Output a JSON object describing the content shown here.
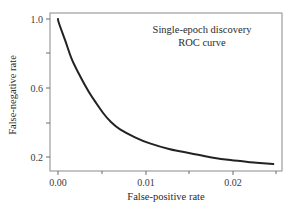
{
  "chart_data": {
    "type": "line",
    "title": "Single-epoch discovery",
    "subtitle": "ROC curve",
    "xlabel": "False-positive rate",
    "ylabel": "False-negative rate",
    "xlim": [
      0.0,
      0.0255
    ],
    "ylim": [
      0.15,
      1.03
    ],
    "grid": false,
    "legend": null,
    "x_ticks": [
      0.0,
      0.005,
      0.01,
      0.015,
      0.02,
      0.025
    ],
    "x_tick_labels": [
      "0.00",
      "",
      "0.01",
      "",
      "0.02",
      ""
    ],
    "y_ticks": [
      0.2,
      0.4,
      0.6,
      0.8,
      1.0
    ],
    "y_tick_labels": [
      "0.2",
      "",
      "0.6",
      "",
      "1.0"
    ],
    "series": [
      {
        "name": "ROC curve",
        "color": "#222222",
        "x": [
          0.0,
          0.0001,
          0.0008,
          0.0016,
          0.0025,
          0.0035,
          0.0044,
          0.0052,
          0.006,
          0.0071,
          0.0088,
          0.0105,
          0.0128,
          0.0151,
          0.0174,
          0.0197,
          0.022,
          0.0246
        ],
        "y": [
          1.0,
          0.977,
          0.879,
          0.764,
          0.671,
          0.579,
          0.51,
          0.452,
          0.406,
          0.36,
          0.314,
          0.279,
          0.245,
          0.222,
          0.199,
          0.182,
          0.17,
          0.159
        ]
      }
    ]
  },
  "labels": {
    "title_line1": "Single-epoch discovery",
    "title_line2": "ROC curve",
    "xlabel": "False-positive rate",
    "ylabel": "False-negative rate",
    "x_tick_0": "0.00",
    "x_tick_1": "0.01",
    "x_tick_2": "0.02",
    "y_tick_0": "0.2",
    "y_tick_1": "0.6",
    "y_tick_2": "1.0"
  }
}
